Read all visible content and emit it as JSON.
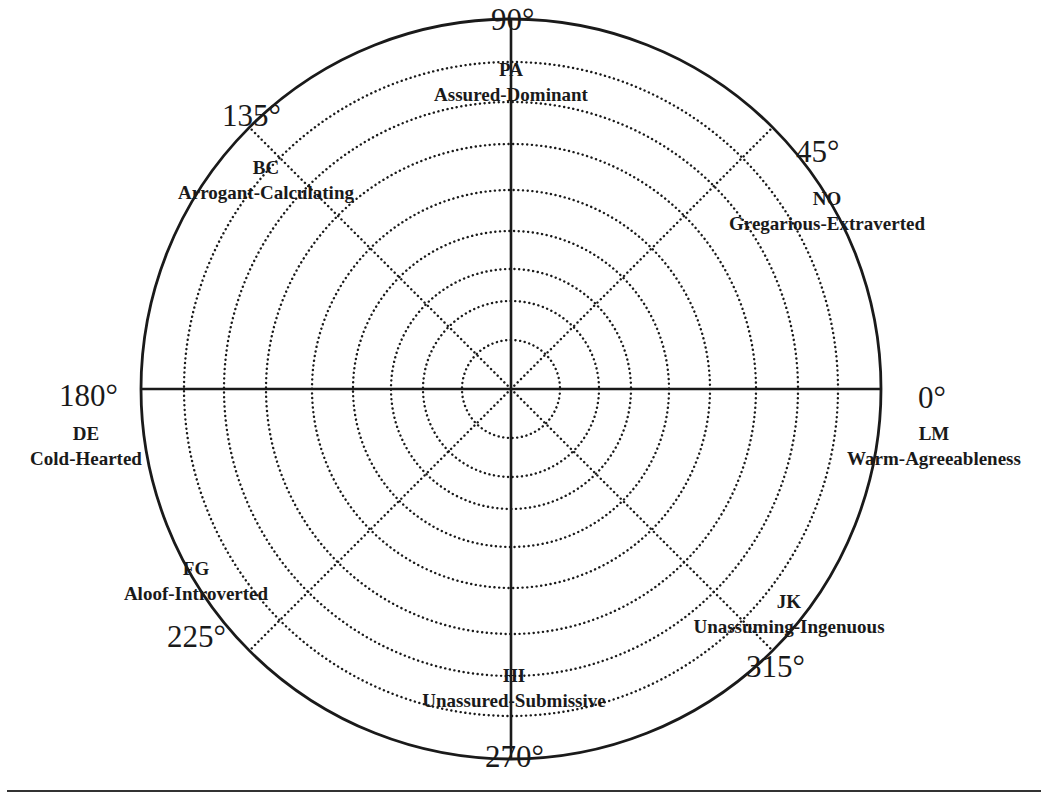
{
  "diagram": {
    "type": "circumplex",
    "center": {
      "x": 511,
      "y": 389
    },
    "outer_radius": 370,
    "ring_radii": [
      49,
      88,
      120,
      158,
      199,
      245,
      287,
      327
    ],
    "axes": {
      "solid": [
        0,
        90,
        180,
        270
      ],
      "dotted": [
        45,
        135,
        225,
        315
      ]
    },
    "colors": {
      "ink": "#1a1a1a",
      "background": "#ffffff"
    }
  },
  "degree_labels": [
    {
      "id": "deg-0",
      "text": "0°",
      "x": 918,
      "y": 382
    },
    {
      "id": "deg-45",
      "text": "45°",
      "x": 796,
      "y": 136
    },
    {
      "id": "deg-90",
      "text": "90°",
      "x": 491,
      "y": 4
    },
    {
      "id": "deg-135",
      "text": "135°",
      "x": 222,
      "y": 100
    },
    {
      "id": "deg-180",
      "text": "180°",
      "x": 59,
      "y": 380
    },
    {
      "id": "deg-225",
      "text": "225°",
      "x": 167,
      "y": 621
    },
    {
      "id": "deg-270",
      "text": "270°",
      "x": 485,
      "y": 741
    },
    {
      "id": "deg-315",
      "text": "315°",
      "x": 746,
      "y": 651
    }
  ],
  "octants": [
    {
      "id": "PA",
      "code": "PA",
      "name": "Assured-Dominant",
      "angle": 90,
      "x": 511,
      "y": 57
    },
    {
      "id": "BC",
      "code": "BC",
      "name": "Arrogant-Calculating",
      "angle": 135,
      "x": 266,
      "y": 155
    },
    {
      "id": "NO",
      "code": "NO",
      "name": "Gregarious-Extraverted",
      "angle": 45,
      "x": 827,
      "y": 186
    },
    {
      "id": "DE",
      "code": "DE",
      "name": "Cold-Hearted",
      "angle": 180,
      "x": 86,
      "y": 421
    },
    {
      "id": "LM",
      "code": "LM",
      "name": "Warm-Agreeableness",
      "angle": 0,
      "x": 934,
      "y": 421
    },
    {
      "id": "FG",
      "code": "FG",
      "name": "Aloof-Introverted",
      "angle": 225,
      "x": 196,
      "y": 556
    },
    {
      "id": "JK",
      "code": "JK",
      "name": "Unassuming-Ingenuous",
      "angle": 315,
      "x": 789,
      "y": 589
    },
    {
      "id": "HI",
      "code": "HI",
      "name": "Unassured-Submissive",
      "angle": 270,
      "x": 514,
      "y": 663
    }
  ]
}
